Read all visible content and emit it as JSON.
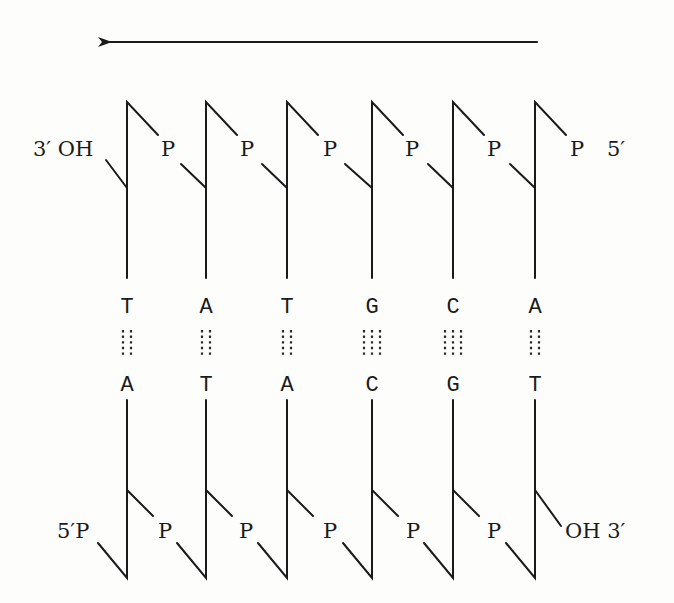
{
  "diagram": {
    "arrow": {
      "direction": "left",
      "meaning": "direction-indicator"
    },
    "top_strand": {
      "end_left_label": "3′ OH",
      "end_right_label": "5′",
      "phosphate_label": "P",
      "phosphates": [
        "P",
        "P",
        "P",
        "P",
        "P",
        "P"
      ],
      "bases": [
        "T",
        "A",
        "T",
        "G",
        "C",
        "A"
      ]
    },
    "bottom_strand": {
      "end_left_label": "5′P",
      "end_right_label": "OH 3′",
      "phosphate_label": "P",
      "phosphates": [
        "P",
        "P",
        "P",
        "P",
        "P"
      ],
      "bases": [
        "A",
        "T",
        "A",
        "C",
        "G",
        "T"
      ]
    },
    "base_pairs": [
      {
        "top": "T",
        "bottom": "A",
        "hydrogen_bonds": 2
      },
      {
        "top": "A",
        "bottom": "T",
        "hydrogen_bonds": 2
      },
      {
        "top": "T",
        "bottom": "A",
        "hydrogen_bonds": 2
      },
      {
        "top": "G",
        "bottom": "C",
        "hydrogen_bonds": 3
      },
      {
        "top": "C",
        "bottom": "G",
        "hydrogen_bonds": 3
      },
      {
        "top": "A",
        "bottom": "T",
        "hydrogen_bonds": 2
      }
    ],
    "colors": {
      "ink": "#1a1a1a",
      "background": "#fdfdfc"
    }
  }
}
